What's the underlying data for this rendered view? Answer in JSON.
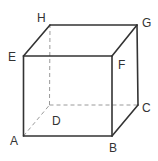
{
  "diagram": {
    "type": "cube",
    "vertices": {
      "A": {
        "label": "A",
        "x": 23.5,
        "y": 136,
        "label_x": 10,
        "label_y": 145
      },
      "B": {
        "label": "B",
        "x": 112,
        "y": 136,
        "label_x": 109,
        "label_y": 152
      },
      "C": {
        "label": "C",
        "x": 138,
        "y": 105,
        "label_x": 142,
        "label_y": 112
      },
      "D": {
        "label": "D",
        "x": 49.5,
        "y": 105,
        "label_x": 52,
        "label_y": 125
      },
      "E": {
        "label": "E",
        "x": 23.5,
        "y": 56,
        "label_x": 8,
        "label_y": 61
      },
      "F": {
        "label": "F",
        "x": 112,
        "y": 56,
        "label_x": 118,
        "label_y": 69
      },
      "G": {
        "label": "G",
        "x": 137,
        "y": 25,
        "label_x": 142,
        "label_y": 27
      },
      "H": {
        "label": "H",
        "x": 50,
        "y": 25,
        "label_x": 37,
        "label_y": 22
      }
    },
    "visible_edges": [
      [
        "A",
        "B"
      ],
      [
        "B",
        "F"
      ],
      [
        "F",
        "E"
      ],
      [
        "E",
        "A"
      ],
      [
        "E",
        "H"
      ],
      [
        "H",
        "G"
      ],
      [
        "G",
        "F"
      ],
      [
        "B",
        "C"
      ],
      [
        "C",
        "G"
      ]
    ],
    "hidden_edges": [
      [
        "A",
        "D"
      ],
      [
        "D",
        "C"
      ],
      [
        "D",
        "H"
      ]
    ],
    "colors": {
      "edge": "#333333",
      "hidden_edge": "#9a9a9a",
      "label": "#333333"
    }
  }
}
